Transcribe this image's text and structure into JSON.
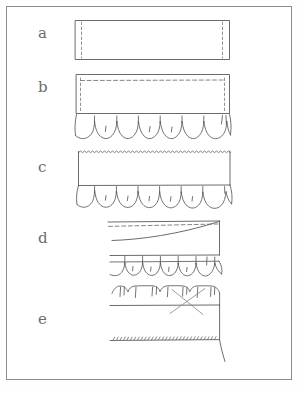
{
  "figure": {
    "ink_color": "#555555",
    "light_ink_color": "#8c8c8c",
    "label_color": "#6d6d6d",
    "paper_color": "#ffffff",
    "border_color": "#8c8c8c"
  },
  "panels": [
    {
      "id": "a",
      "label": "a",
      "label_x": 38,
      "label_y": 33,
      "caption": "Flat fabric band with vertical dashed fold lines at both ends",
      "features": [
        "rectangle-band",
        "dashed-vertical-left",
        "dashed-vertical-right"
      ]
    },
    {
      "id": "b",
      "label": "b",
      "label_x": 38,
      "label_y": 87,
      "caption": "Band with horizontal dashed stitch line near top and gathered ruffle attached below",
      "features": [
        "rectangle-band",
        "dashed-horizontal-top",
        "dashed-vertical-left",
        "dashed-vertical-right",
        "gathered-ruffle"
      ]
    },
    {
      "id": "c",
      "label": "c",
      "label_x": 38,
      "label_y": 166,
      "caption": "Band with pinked zigzag top edge, seam line and gathered ruffle below",
      "features": [
        "rectangle-band",
        "pinked-zigzag-top-edge",
        "seam-line",
        "gathered-ruffle"
      ]
    },
    {
      "id": "d",
      "label": "d",
      "label_x": 38,
      "label_y": 238,
      "caption": "Band turned with a swept curve, dashed line at top and gathered edge below",
      "features": [
        "top-edge-line",
        "dashed-horizontal-top",
        "sweep-curve",
        "seam-line",
        "gathered-edge"
      ]
    },
    {
      "id": "e",
      "label": "e",
      "label_x": 38,
      "label_y": 320,
      "caption": "Gathered scalloped edge with crossed-out X mark and hand-stitched hem line below",
      "features": [
        "scalloped-gathered-edge",
        "x-cross-mark",
        "stitched-hem-line",
        "side-seam-curve"
      ]
    }
  ],
  "geometry": {
    "frame": {
      "x": 6,
      "y": 6,
      "width": 286,
      "height": 374
    },
    "panel_a": {
      "rect": {
        "x": 75,
        "y": 20,
        "width": 155,
        "height": 40
      },
      "dash_left_x": 81,
      "dash_right_x": 223
    },
    "panel_b": {
      "rect": {
        "x": 76,
        "y": 74,
        "width": 154,
        "height": 40
      },
      "dash_top_y": 80,
      "ruffle_y": 114,
      "ruffle_depth": 23
    },
    "panel_c": {
      "rect": {
        "x": 78,
        "y": 151,
        "width": 152,
        "height": 34
      },
      "ruffle_y": 185,
      "ruffle_depth": 21
    },
    "panel_d": {
      "top_y": 222,
      "dash_y": 226,
      "bottom_y": 256,
      "ruffle_y": 262,
      "right_x": 219
    },
    "panel_e": {
      "scallop_y": 288,
      "seam_y": 305,
      "hem_y": 340,
      "right_x": 219
    }
  },
  "marks": {
    "x_cross": {
      "label": "cancel-cross-mark",
      "cx": 188,
      "cy": 302
    },
    "stitch_hem": {
      "label": "running-stitch-hem",
      "y": 340
    }
  }
}
